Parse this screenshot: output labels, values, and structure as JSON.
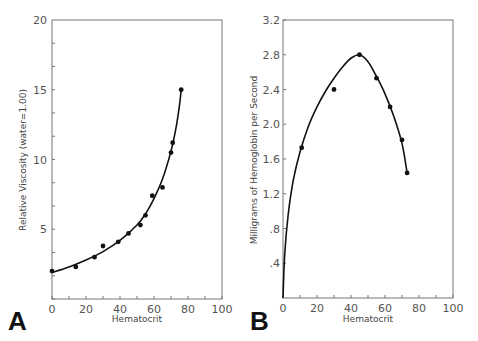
{
  "chart_data": [
    {
      "panel": "A",
      "type": "scatter",
      "title": "",
      "xlabel": "Hematocrit",
      "ylabel": "Relative Viscosity (water=1.00)",
      "xlim": [
        0,
        100
      ],
      "ylim": [
        0,
        20
      ],
      "x_ticks": [
        0,
        20,
        40,
        60,
        80,
        100
      ],
      "y_ticks": [
        5,
        10,
        15,
        20
      ],
      "grid": false,
      "legend": null,
      "points": {
        "x": [
          0,
          14,
          25,
          30,
          39,
          45,
          52,
          55,
          59,
          65,
          70,
          71,
          76
        ],
        "y": [
          2.0,
          2.3,
          3.0,
          3.8,
          4.1,
          4.7,
          5.3,
          6.0,
          7.4,
          8.0,
          10.5,
          11.2,
          15.0
        ]
      },
      "fit_curve": {
        "x": [
          0,
          10,
          20,
          30,
          40,
          50,
          55,
          60,
          65,
          70,
          73,
          75,
          76
        ],
        "y": [
          1.9,
          2.3,
          2.8,
          3.4,
          4.2,
          5.3,
          6.1,
          7.2,
          8.6,
          10.6,
          12.3,
          13.9,
          15.0
        ]
      }
    },
    {
      "panel": "B",
      "type": "scatter",
      "title": "",
      "xlabel": "Hematocrit",
      "ylabel": "Milligrams of Hemoglobin per Second",
      "xlim": [
        0,
        100
      ],
      "ylim": [
        0,
        3.2
      ],
      "x_ticks": [
        0,
        20,
        40,
        60,
        80,
        100
      ],
      "y_ticks": [
        ".4",
        ".8",
        "1.2",
        "1.6",
        "2.0",
        "2.4",
        "2.8",
        "3.2"
      ],
      "grid": false,
      "legend": null,
      "points": {
        "x": [
          11,
          30,
          45,
          55,
          63,
          70,
          73
        ],
        "y": [
          1.73,
          2.4,
          2.8,
          2.53,
          2.2,
          1.82,
          1.44
        ]
      },
      "fit_curve": {
        "x": [
          0,
          1,
          3,
          6,
          10,
          15,
          20,
          25,
          30,
          35,
          40,
          45,
          50,
          55,
          60,
          65,
          70,
          73
        ],
        "y": [
          0,
          0.5,
          0.95,
          1.35,
          1.68,
          1.98,
          2.2,
          2.38,
          2.53,
          2.66,
          2.76,
          2.8,
          2.72,
          2.55,
          2.35,
          2.1,
          1.78,
          1.44
        ]
      }
    }
  ],
  "panels": {
    "A": {
      "letter": "A",
      "xlabel": "Hematocrit",
      "ylabel": "Relative Viscosity (water=1.00)",
      "x_tick_labels": [
        "0",
        "20",
        "40",
        "60",
        "80",
        "100"
      ],
      "y_tick_labels": [
        "5",
        "10",
        "15",
        "20"
      ]
    },
    "B": {
      "letter": "B",
      "xlabel": "Hematocrit",
      "ylabel": "Milligrams of Hemoglobin per Second",
      "x_tick_labels": [
        "0",
        "20",
        "40",
        "60",
        "80",
        "100"
      ],
      "y_tick_labels": [
        ".4",
        ".8",
        "1.2",
        "1.6",
        "2.0",
        "2.4",
        "2.8",
        "3.2"
      ]
    }
  },
  "colors": {
    "axis": "#777777",
    "curve": "#111111",
    "points": "#111111"
  }
}
